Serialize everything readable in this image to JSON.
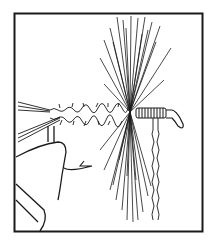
{
  "figure": {
    "colors": {
      "ink": "#1a1a1a",
      "background": "#ffffff"
    },
    "elements": [
      "frame",
      "tail-fibers",
      "dubbed-body",
      "hackle-fibers",
      "thread-wraps",
      "hook-eye",
      "hanging-thread",
      "vise-jaw",
      "hook-bend"
    ]
  }
}
